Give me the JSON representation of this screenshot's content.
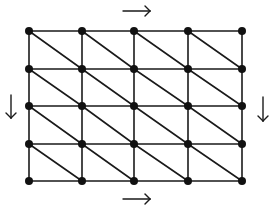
{
  "diagram": {
    "type": "triangulated-grid",
    "colors": {
      "line": "#1a1a1a",
      "node": "#111111",
      "background": "#ffffff"
    },
    "grid": {
      "columns_x": [
        29,
        82,
        134,
        188,
        242
      ],
      "rows_y": [
        31,
        69,
        106,
        144,
        181
      ],
      "node_radius": 4,
      "diagonal_direction": "top-left-to-bottom-right"
    },
    "arrows": [
      {
        "name": "top-arrow",
        "direction": "right",
        "x1": 123,
        "y1": 11,
        "x2": 150,
        "y2": 11
      },
      {
        "name": "bottom-arrow",
        "direction": "right",
        "x1": 123,
        "y1": 199,
        "x2": 150,
        "y2": 199
      },
      {
        "name": "left-arrow",
        "direction": "down",
        "x1": 11,
        "y1": 95,
        "x2": 11,
        "y2": 118
      },
      {
        "name": "right-arrow",
        "direction": "down",
        "x1": 263,
        "y1": 97,
        "x2": 263,
        "y2": 121
      }
    ]
  }
}
